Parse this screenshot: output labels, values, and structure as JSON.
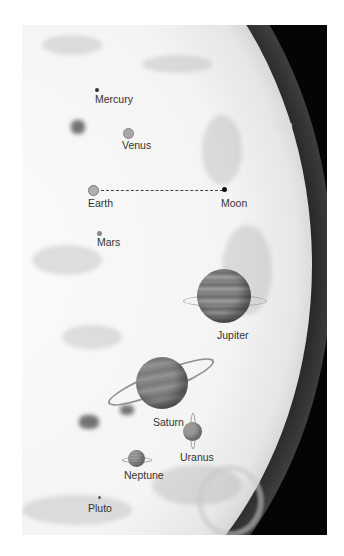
{
  "figure": {
    "sun": {
      "label": "Sun"
    },
    "planets": [
      {
        "name": "Mercury",
        "label": "Mercury"
      },
      {
        "name": "Venus",
        "label": "Venus"
      },
      {
        "name": "Earth",
        "label": "Earth"
      },
      {
        "name": "Moon",
        "label": "Moon"
      },
      {
        "name": "Mars",
        "label": "Mars"
      },
      {
        "name": "Jupiter",
        "label": "Jupiter"
      },
      {
        "name": "Saturn",
        "label": "Saturn"
      },
      {
        "name": "Uranus",
        "label": "Uranus"
      },
      {
        "name": "Neptune",
        "label": "Neptune"
      },
      {
        "name": "Pluto",
        "label": "Pluto"
      }
    ],
    "colors": {
      "background": "#050505",
      "sun_surface": "#f4f4f4",
      "label": "#333333",
      "sun_label": "#dddddd"
    }
  }
}
